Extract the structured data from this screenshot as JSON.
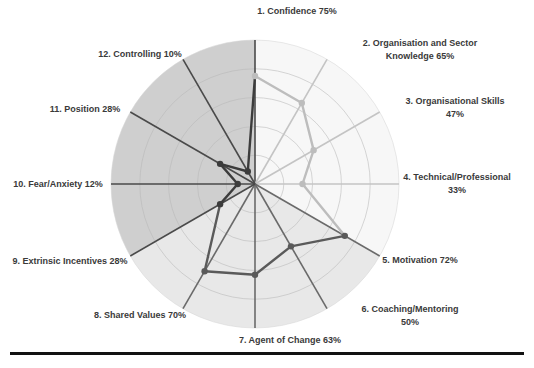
{
  "chart_data": {
    "type": "radar",
    "title": "",
    "categories": [
      "1. Confidence",
      "2. Organisation and Sector Knowledge",
      "3. Organisational Skills",
      "4. Technical/Professional",
      "5. Motivation",
      "6. Coaching/Mentoring",
      "7. Agent of Change",
      "8. Shared Values",
      "9. Extrinsic Incentives",
      "10. Fear/Anxiety",
      "11. Position",
      "12. Controlling"
    ],
    "labels": [
      [
        "1. Confidence 75%"
      ],
      [
        "2. Organisation and Sector",
        "Knowledge 65%"
      ],
      [
        "3. Organisational Skills",
        "47%"
      ],
      [
        "4. Technical/Professional",
        "33%"
      ],
      [
        "5. Motivation 72%"
      ],
      [
        "6. Coaching/Mentoring",
        "50%"
      ],
      [
        "7. Agent of Change 63%"
      ],
      [
        "8. Shared Values 70%"
      ],
      [
        "9. Extrinsic Incentives 28%"
      ],
      [
        "10. Fear/Anxiety 12%"
      ],
      [
        "11. Position 28%"
      ],
      [
        "12. Controlling 10%"
      ]
    ],
    "series": [
      {
        "name": "Score",
        "values": [
          75,
          65,
          47,
          33,
          72,
          50,
          63,
          70,
          28,
          12,
          28,
          10
        ],
        "unit": "%"
      }
    ],
    "rlim": [
      0,
      100
    ],
    "grid_rings": [
      20,
      40,
      60,
      80,
      100
    ],
    "grid": true,
    "legend": "none",
    "sectors": [
      {
        "name": "upper-right",
        "from_axis": 1,
        "to_axis": 5,
        "fill": "#f7f7f7",
        "axis_color": "#c4c4c4",
        "line_color": "#bdbdbd"
      },
      {
        "name": "lower",
        "from_axis": 5,
        "to_axis": 9,
        "fill": "#e8e8e8",
        "axis_color": "#6a6a6a",
        "line_color": "#5a5a5a"
      },
      {
        "name": "upper-left",
        "from_axis": 9,
        "to_axis": 1,
        "fill": "#cfcfcf",
        "axis_color": "#4a4a4a",
        "line_color": "#3c3c3c"
      }
    ]
  }
}
